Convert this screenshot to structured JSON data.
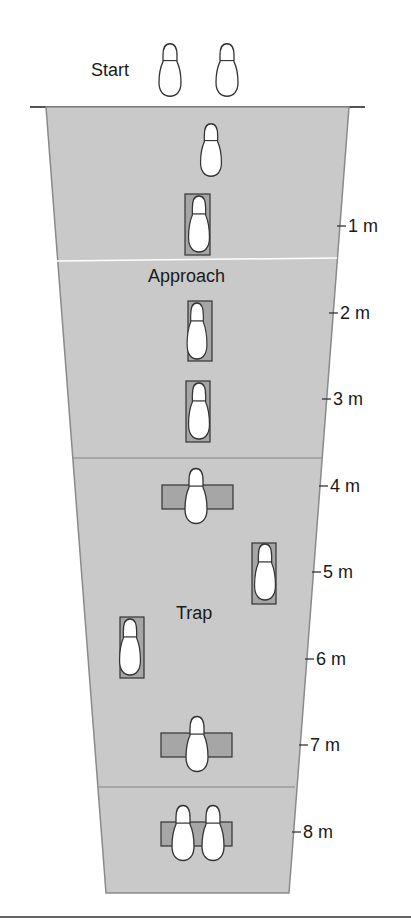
{
  "diagram": {
    "start_label": "Start",
    "zones": [
      {
        "name": "Approach",
        "label": "Approach"
      },
      {
        "name": "Trap",
        "label": "Trap"
      }
    ],
    "distance_marks": [
      "1 m",
      "2 m",
      "3 m",
      "4 m",
      "5 m",
      "6 m",
      "7 m",
      "8 m"
    ],
    "colors": {
      "track_fill": "#c9c9c9",
      "pad_fill": "#a6a6a6",
      "outline": "#333333",
      "divider": "#9a9a9a",
      "footprint_fill": "#ffffff"
    }
  }
}
